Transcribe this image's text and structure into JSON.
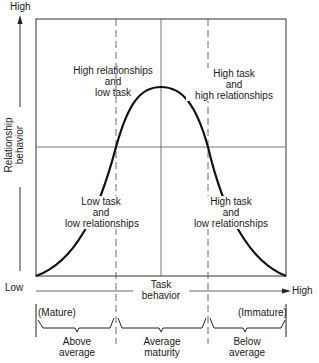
{
  "diagram": {
    "type": "situational-leadership-curve",
    "y_axis": {
      "label_line1": "Relationship",
      "label_line2": "behavior",
      "high_label": "High",
      "low_label": "Low"
    },
    "x_axis": {
      "label_line1": "Task",
      "label_line2": "behavior",
      "high_label": "High"
    },
    "quadrants": [
      {
        "id": "q3",
        "line1": "High relationships",
        "line2": "and",
        "line3": "low task"
      },
      {
        "id": "q2",
        "line1": "High task",
        "line2": "and",
        "line3": "high relationships"
      },
      {
        "id": "q4",
        "line1": "Low task",
        "line2": "and",
        "line3": "low relationships"
      },
      {
        "id": "q1",
        "line1": "High task",
        "line2": "and",
        "line3": "low relationships"
      }
    ],
    "maturity": {
      "left_end": "(Mature)",
      "right_end": "(Immature)",
      "segments": [
        {
          "line1": "Above",
          "line2": "average"
        },
        {
          "line1": "Average",
          "line2": "maturity"
        },
        {
          "line1": "Below",
          "line2": "average"
        }
      ]
    },
    "colors": {
      "ink": "#1a1a1a",
      "grid": "#555555",
      "background": "#ffffff"
    }
  }
}
